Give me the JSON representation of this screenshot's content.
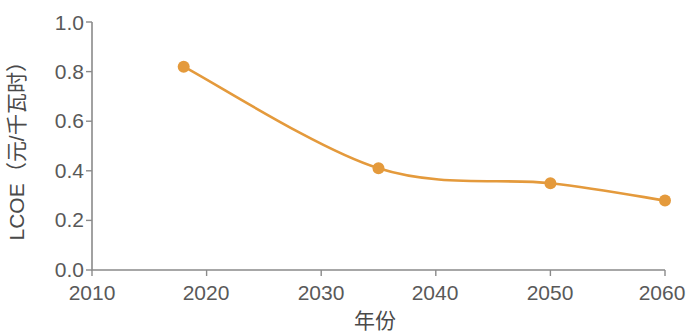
{
  "chart_data": {
    "type": "line",
    "title": "",
    "xlabel": "年份",
    "ylabel": "LCOE（元/千瓦时）",
    "xlim": [
      2010,
      2060
    ],
    "ylim": [
      0.0,
      1.0
    ],
    "xticks": [
      2010,
      2020,
      2030,
      2040,
      2050,
      2060
    ],
    "xtick_labels": [
      "2010",
      "2020",
      "2030",
      "2040",
      "2050",
      "2060"
    ],
    "yticks": [
      0.0,
      0.2,
      0.4,
      0.6,
      0.8,
      1.0
    ],
    "ytick_labels": [
      "0.0",
      "0.2",
      "0.4",
      "0.6",
      "0.8",
      "1.0"
    ],
    "grid": false,
    "legend": false,
    "legend_position": "none",
    "series": [
      {
        "name": "LCOE",
        "color": "#e49a3c",
        "marker": "circle",
        "x": [
          2018,
          2035,
          2050,
          2060
        ],
        "values": [
          0.82,
          0.41,
          0.35,
          0.28
        ],
        "points": [
          {
            "x": 2018,
            "y": 0.82
          },
          {
            "x": 2035,
            "y": 0.41
          },
          {
            "x": 2050,
            "y": 0.35
          },
          {
            "x": 2060,
            "y": 0.28
          }
        ]
      }
    ],
    "colors": {
      "series": "#e49a3c",
      "axis": "#8a8a8a",
      "tick_text": "#595959",
      "label_text": "#4a4a4a",
      "background": "#ffffff"
    }
  }
}
